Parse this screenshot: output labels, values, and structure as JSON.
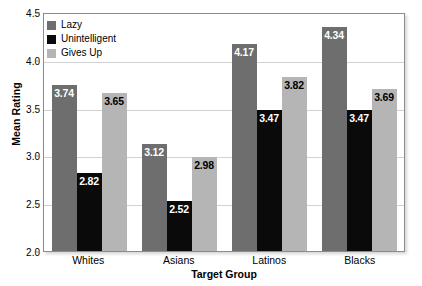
{
  "chart_data": {
    "type": "bar",
    "title": "",
    "xlabel": "Target Group",
    "ylabel": "Mean Rating",
    "ylim": [
      2.0,
      4.5
    ],
    "ytick_labels": [
      "2.0",
      "2.5",
      "3.0",
      "3.5",
      "4.0",
      "4.5"
    ],
    "yticks": [
      2.0,
      2.5,
      3.0,
      3.5,
      4.0,
      4.5
    ],
    "grid": true,
    "legend_position": "top-left",
    "categories": [
      "Whites",
      "Asians",
      "Latinos",
      "Blacks"
    ],
    "series": [
      {
        "name": "Lazy",
        "color": "#6e6e6e",
        "label_color": "on-dark",
        "values": [
          3.74,
          3.12,
          4.17,
          4.34
        ],
        "labels": [
          "3.74",
          "3.12",
          "4.17",
          "4.34"
        ]
      },
      {
        "name": "Unintelligent",
        "color": "#0a0a0a",
        "label_color": "on-dark",
        "values": [
          2.82,
          2.52,
          3.47,
          3.47
        ],
        "labels": [
          "2.82",
          "2.52",
          "3.47",
          "3.47"
        ]
      },
      {
        "name": "Gives Up",
        "color": "#b5b5b5",
        "label_color": "on-light",
        "values": [
          3.65,
          2.98,
          3.82,
          3.69
        ],
        "labels": [
          "3.65",
          "2.98",
          "3.82",
          "3.69"
        ]
      }
    ]
  }
}
